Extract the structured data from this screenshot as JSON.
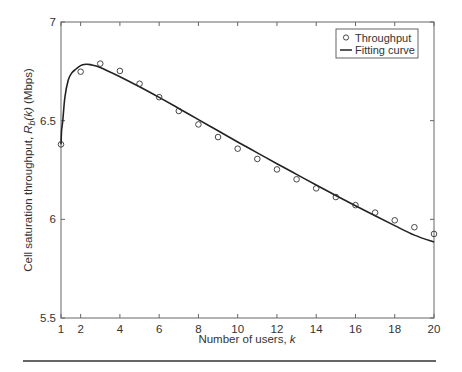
{
  "chart_data": {
    "type": "line",
    "title": "",
    "xlabel": "Number of users, ",
    "xlabel_italic": "k",
    "ylabel_prefix": "Cell saturation throughput, ",
    "ylabel_symbol": "R",
    "ylabel_subscript": "b",
    "ylabel_arg": "(k)",
    "ylabel_unit": " (Mbps)",
    "xlim": [
      1,
      20
    ],
    "ylim": [
      5.5,
      7
    ],
    "x_ticks": [
      1,
      2,
      4,
      6,
      8,
      10,
      12,
      14,
      16,
      18,
      20
    ],
    "x_tick_labels": [
      "1",
      "2",
      "4",
      "6",
      "8",
      "10",
      "12",
      "14",
      "16",
      "18",
      "20"
    ],
    "y_ticks": [
      5.5,
      6,
      6.5,
      7
    ],
    "y_tick_labels": [
      "5.5",
      "6",
      "6.5",
      "7"
    ],
    "grid": false,
    "legend_position": "top-right",
    "series": [
      {
        "name": "Throughput",
        "kind": "scatter",
        "marker": "open-circle",
        "color": "#333333",
        "x": [
          1,
          2,
          3,
          4,
          5,
          6,
          7,
          8,
          9,
          10,
          11,
          12,
          13,
          14,
          15,
          16,
          17,
          18,
          19,
          20
        ],
        "y": [
          6.38,
          6.748,
          6.789,
          6.752,
          6.687,
          6.619,
          6.549,
          6.481,
          6.417,
          6.358,
          6.306,
          6.253,
          6.203,
          6.157,
          6.113,
          6.072,
          6.034,
          5.995,
          5.96,
          5.926
        ]
      },
      {
        "name": "Fitting curve",
        "kind": "line",
        "color": "#222222",
        "x": [
          1,
          1.03,
          1.09,
          1.2,
          1.37,
          1.55,
          1.71,
          1.9,
          2.1,
          2.27,
          2.5,
          3,
          4,
          5,
          6,
          7,
          8,
          9,
          10,
          11,
          12,
          13,
          14,
          15,
          16,
          17,
          18,
          19,
          20
        ],
        "y": [
          6.38,
          6.45,
          6.5,
          6.62,
          6.706,
          6.742,
          6.757,
          6.773,
          6.783,
          6.786,
          6.784,
          6.77,
          6.723,
          6.672,
          6.618,
          6.562,
          6.505,
          6.449,
          6.392,
          6.337,
          6.282,
          6.228,
          6.174,
          6.121,
          6.069,
          6.018,
          5.968,
          5.92,
          5.885
        ]
      }
    ]
  }
}
